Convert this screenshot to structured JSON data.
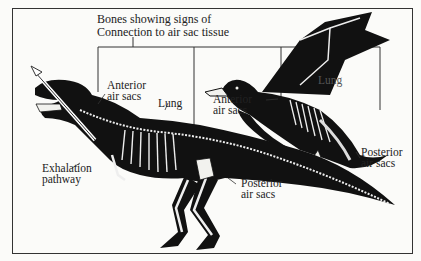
{
  "diagram": {
    "title_line1": "Bones showing signs of",
    "title_line2": "Connection to air sac tissue",
    "dinosaur_labels": {
      "anterior_line1": "Anterior",
      "anterior_line2": "air sacs",
      "lung": "Lung",
      "exhalation_line1": "Exhalation",
      "exhalation_line2": "pathway",
      "posterior_line1": "Posterior",
      "posterior_line2": "air sacs"
    },
    "bird_labels": {
      "anterior_line1": "Anterior",
      "anterior_line2": "air sacs",
      "lung": "Lung",
      "posterior_line1": "Posterior",
      "posterior_line2": "air sacs"
    },
    "colors": {
      "silhouette": "#111111",
      "bone": "#f2f2ee",
      "line": "#333333",
      "background": "#fbfbf9"
    }
  }
}
